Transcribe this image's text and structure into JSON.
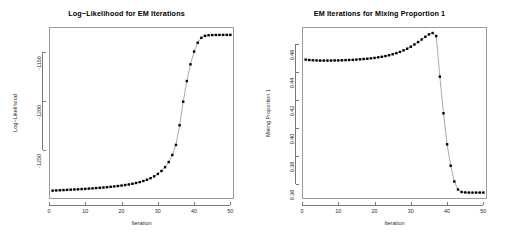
{
  "chart_data": [
    {
      "type": "line",
      "id": "log-likelihood",
      "title": "Log−Likelihood for EM Iterations",
      "xlabel": "Iteration",
      "ylabel": "Log−Likelihood",
      "grid": false,
      "legend": null,
      "markers": "filled-square",
      "xlim": [
        0,
        51
      ],
      "ylim": [
        -1300,
        -1125
      ],
      "xticks": [
        0,
        10,
        20,
        30,
        40,
        50
      ],
      "xticklabels": [
        "0",
        "10",
        "20",
        "30",
        "40",
        "50"
      ],
      "yticks": [
        -1250,
        -1200,
        -1150
      ],
      "yticklabels": [
        "-1250",
        "-1200",
        "-1150"
      ],
      "x": [
        1,
        2,
        3,
        4,
        5,
        6,
        7,
        8,
        9,
        10,
        11,
        12,
        13,
        14,
        15,
        16,
        17,
        18,
        19,
        20,
        21,
        22,
        23,
        24,
        25,
        26,
        27,
        28,
        29,
        30,
        31,
        32,
        33,
        34,
        35,
        36,
        37,
        38,
        39,
        40,
        41,
        42,
        43,
        44,
        45,
        46,
        47,
        48,
        49,
        50
      ],
      "values": [
        -1291.5,
        -1291.3,
        -1291.1,
        -1290.9,
        -1290.7,
        -1290.5,
        -1290.3,
        -1290.1,
        -1289.9,
        -1289.7,
        -1289.4,
        -1289.2,
        -1288.9,
        -1288.6,
        -1288.3,
        -1288.0,
        -1287.6,
        -1287.2,
        -1286.8,
        -1286.3,
        -1285.8,
        -1285.2,
        -1284.5,
        -1283.7,
        -1282.8,
        -1281.7,
        -1280.4,
        -1278.8,
        -1276.9,
        -1274.5,
        -1271.5,
        -1267.6,
        -1262.4,
        -1255.2,
        -1245.0,
        -1225.0,
        -1201.0,
        -1180.0,
        -1163.0,
        -1150.0,
        -1141.0,
        -1136.0,
        -1134.0,
        -1133.4,
        -1133.2,
        -1133.1,
        -1133.05,
        -1133.02,
        -1133.01,
        -1133.0
      ]
    },
    {
      "type": "line",
      "id": "mixing-proportion",
      "title": "EM Iterations for Mixing Proportion 1",
      "xlabel": "Iteration",
      "ylabel": "Mixing Proportion 1",
      "grid": false,
      "legend": null,
      "markers": "filled-square",
      "xlim": [
        0,
        51
      ],
      "ylim": [
        0.3495,
        0.4725
      ],
      "xticks": [
        0,
        10,
        20,
        30,
        40,
        50
      ],
      "xticklabels": [
        "0",
        "10",
        "20",
        "30",
        "40",
        "50"
      ],
      "yticks": [
        0.36,
        0.38,
        0.4,
        0.42,
        0.44,
        0.46
      ],
      "yticklabels": [
        "0.36",
        "0.38",
        "0.40",
        "0.42",
        "0.44",
        "0.46"
      ],
      "x": [
        1,
        2,
        3,
        4,
        5,
        6,
        7,
        8,
        9,
        10,
        11,
        12,
        13,
        14,
        15,
        16,
        17,
        18,
        19,
        20,
        21,
        22,
        23,
        24,
        25,
        26,
        27,
        28,
        29,
        30,
        31,
        32,
        33,
        34,
        35,
        36,
        37,
        38,
        39,
        40,
        41,
        42,
        43,
        44,
        45,
        46,
        47,
        48,
        49,
        50
      ],
      "values": [
        0.4492,
        0.4489,
        0.4487,
        0.4486,
        0.4485,
        0.4485,
        0.4485,
        0.4485,
        0.4486,
        0.4486,
        0.4487,
        0.4488,
        0.4489,
        0.449,
        0.4492,
        0.4494,
        0.4496,
        0.4498,
        0.4501,
        0.4504,
        0.4508,
        0.4512,
        0.4517,
        0.4523,
        0.453,
        0.4538,
        0.4547,
        0.4558,
        0.457,
        0.4584,
        0.46,
        0.4617,
        0.4636,
        0.4655,
        0.4672,
        0.4682,
        0.466,
        0.437,
        0.4108,
        0.3886,
        0.3733,
        0.362,
        0.3563,
        0.3545,
        0.3542,
        0.3541,
        0.3541,
        0.3541,
        0.3541,
        0.3541
      ]
    }
  ]
}
